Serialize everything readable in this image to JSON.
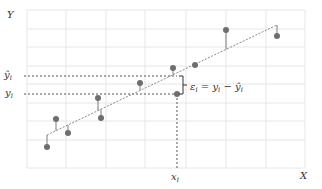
{
  "chart_data": {
    "type": "scatter",
    "title": "",
    "xlabel": "X",
    "ylabel": "Y",
    "grid": true,
    "plot_box": {
      "left": 27,
      "right": 305,
      "top": 10,
      "bottom": 168
    },
    "v_gridlines_px": [
      27,
      66,
      106,
      145,
      186,
      226,
      266,
      305
    ],
    "h_gridlines_px": [
      10,
      29,
      47,
      66,
      84,
      103,
      121,
      140,
      168
    ],
    "regression_line_px": {
      "x1": 47,
      "y1": 135,
      "x2": 277,
      "y2": 25
    },
    "points_px": [
      {
        "x": 47,
        "y": 147
      },
      {
        "x": 56,
        "y": 119
      },
      {
        "x": 68,
        "y": 133
      },
      {
        "x": 98,
        "y": 98
      },
      {
        "x": 101,
        "y": 118
      },
      {
        "x": 140,
        "y": 83
      },
      {
        "x": 173,
        "y": 68
      },
      {
        "x": 177,
        "y": 94
      },
      {
        "x": 195,
        "y": 65
      },
      {
        "x": 226,
        "y": 30
      },
      {
        "x": 277,
        "y": 36
      }
    ],
    "highlight": {
      "x_px": 177,
      "y_actual_px": 94,
      "y_hat_px": 76,
      "x_label": "x",
      "x_sub": "i",
      "y_label": "y",
      "y_sub": "i",
      "yhat_label": "ŷ",
      "yhat_sub": "i",
      "residual_label": "ε",
      "residual_sub": "i",
      "equation_eq": " = ",
      "equation_minus": " − "
    },
    "colors": {
      "point": "#6e6e6e",
      "line": "#8a8a8a",
      "grid": "#e6e6e6",
      "guide": "#555555",
      "text": "#333333"
    }
  },
  "axes": {
    "x_label": "X",
    "y_label": "Y"
  }
}
